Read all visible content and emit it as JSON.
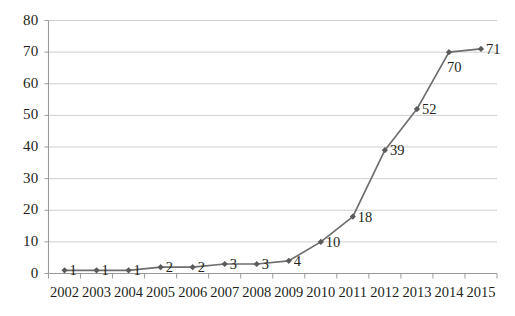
{
  "chart_data": {
    "type": "line",
    "title": "",
    "subtitle": "",
    "xlabel": "",
    "ylabel": "",
    "categories": [
      "2002",
      "2003",
      "2004",
      "2005",
      "2006",
      "2007",
      "2008",
      "2009",
      "2010",
      "2011",
      "2012",
      "2013",
      "2014",
      "2015"
    ],
    "values": [
      1,
      1,
      1,
      2,
      2,
      3,
      3,
      4,
      10,
      18,
      39,
      52,
      70,
      71
    ],
    "series": [
      {
        "name": "",
        "values": [
          1,
          1,
          1,
          2,
          2,
          3,
          3,
          4,
          10,
          18,
          39,
          52,
          70,
          71
        ]
      }
    ],
    "point_labels": [
      "1",
      "1",
      "1",
      "2",
      "2",
      "3",
      "3",
      "4",
      "10",
      "18",
      "39",
      "52",
      "70",
      "71"
    ],
    "ylim": [
      0,
      80
    ],
    "yticks": [
      0,
      10,
      20,
      30,
      40,
      50,
      60,
      70,
      80
    ],
    "ytick_labels": [
      "0",
      "10",
      "20",
      "30",
      "40",
      "50",
      "60",
      "70",
      "80"
    ],
    "grid": "horizontal",
    "grid_color": "#c9c9c9",
    "legend": "none",
    "line_color": "#6e6e6e",
    "marker": "diamond",
    "marker_color": "#5a5a5a",
    "axis_color": "#9a9a9a",
    "text_color": "#231f20",
    "background": "#ffffff"
  },
  "axes": {
    "y_axis_name": "value-axis",
    "x_axis_name": "category-axis"
  }
}
